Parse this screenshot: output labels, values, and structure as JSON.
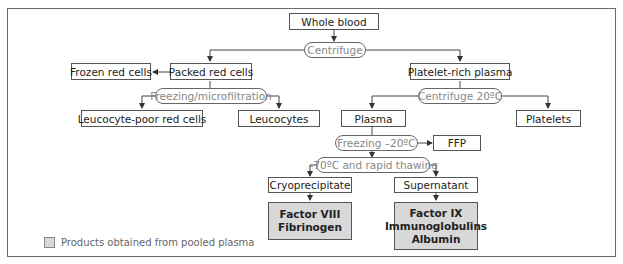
{
  "nodes": {
    "whole_blood": "Whole blood",
    "centrifuge": "Centrifuge",
    "packed_red_cells": "Packed red cells",
    "frozen_red_cells": "Frozen red cells",
    "freezing_microfiltration": "Freezing/microfiltration",
    "leucocyte_poor": "Leucocyte-poor red cells",
    "leucocytes": "Leucocytes",
    "platelet_rich_plasma": "Platelet-rich plasma",
    "centrifuge_20": "Centrifuge 20ºC",
    "plasma": "Plasma",
    "platelets": "Platelets",
    "freezing_20": "Freezing –20ºC",
    "ffp": "FFP",
    "minus70": "–70ºC and rapid thawing",
    "cryoprecipitate": "Cryoprecipitate",
    "supernatant": "Supernatant",
    "cryo_products": [
      "Factor VIII",
      "Fibrinogen"
    ],
    "super_products": [
      "Factor IX",
      "Immunoglobulins",
      "Albumin"
    ]
  },
  "legend": {
    "label": "Products obtained from pooled plasma",
    "swatch_color": "#d8d8d8"
  }
}
